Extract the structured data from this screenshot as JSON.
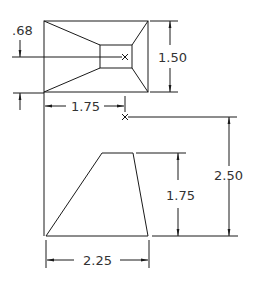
{
  "drawing": {
    "title": "Orthographic views with dimensions",
    "top_view": {
      "offset_label": ".68",
      "height_label": "1.50",
      "width_to_point_label": "1.75"
    },
    "front_view": {
      "height_label": "1.75",
      "point_height_label": "2.50",
      "base_width_label": "2.25"
    }
  }
}
